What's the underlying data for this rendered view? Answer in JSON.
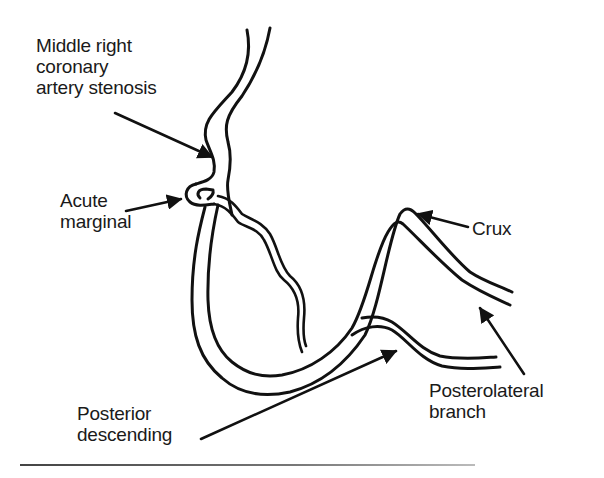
{
  "figure": {
    "labels": {
      "stenosis": "Middle right\ncoronary\nartery stenosis",
      "acute_marginal": "Acute\nmarginal",
      "crux": "Crux",
      "posterolateral": "Posterolateral\nbranch",
      "posterior_descending": "Posterior\ndescending"
    },
    "colors": {
      "line": "#111111",
      "background": "#ffffff"
    }
  }
}
